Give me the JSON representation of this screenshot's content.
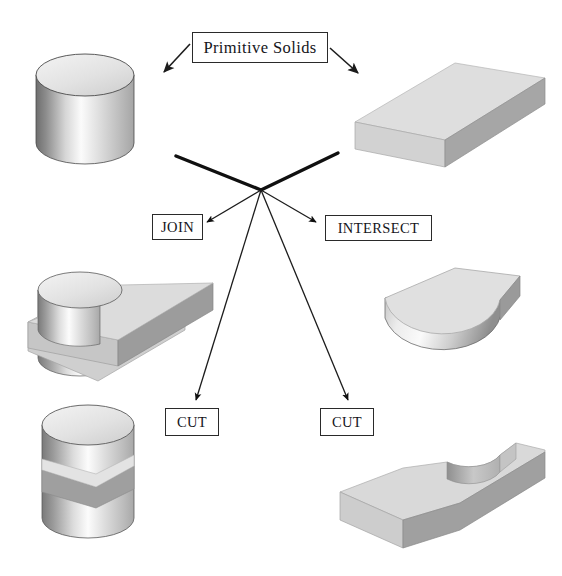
{
  "diagram": {
    "labels": {
      "primitive_solids": "Primitive Solids",
      "join": "JOIN",
      "intersect": "INTERSECT",
      "cut_left": "CUT",
      "cut_right": "CUT"
    },
    "solids": {
      "cylinder": "cylinder-primitive",
      "box": "rectangular-box-primitive",
      "join_result": "cylinder-box-union",
      "intersect_result": "half-disc-intersection",
      "cut_left_result": "cylinder-with-slot-cut",
      "cut_right_result": "box-with-circular-notch-cut"
    },
    "arrows": [
      {
        "name": "arrow-to-cylinder",
        "from": "Primitive Solids",
        "to": "cylinder"
      },
      {
        "name": "arrow-to-box",
        "from": "Primitive Solids",
        "to": "box"
      },
      {
        "name": "arrow-from-cylinder-to-hub",
        "from": "cylinder",
        "to": "hub"
      },
      {
        "name": "arrow-from-box-to-hub",
        "from": "box",
        "to": "hub"
      },
      {
        "name": "arrow-hub-to-join",
        "from": "hub",
        "to": "JOIN"
      },
      {
        "name": "arrow-hub-to-intersect",
        "from": "hub",
        "to": "INTERSECT"
      },
      {
        "name": "arrow-hub-to-cut-left",
        "from": "hub",
        "to": "CUT"
      },
      {
        "name": "arrow-hub-to-cut-right",
        "from": "hub",
        "to": "CUT"
      }
    ],
    "colors": {
      "line": "#1c1c1c",
      "box_border": "#2a2a2a",
      "face_top": "#d9d9d9",
      "face_front": "#cfcfcf",
      "face_side": "#9e9e9e",
      "background": "#ffffff"
    }
  }
}
